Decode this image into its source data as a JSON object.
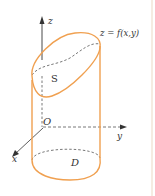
{
  "diagram": {
    "title": "",
    "colors": {
      "surface": "#F0A050",
      "axis": "#333333",
      "dashed": "#555555",
      "edge_line": "#F2E6D8"
    },
    "labels": {
      "z_axis": "z",
      "y_axis": "y",
      "x_axis": "x",
      "origin": "O",
      "surface_eq": "z = f(x,y)",
      "surface_name": "S",
      "region": "D"
    }
  }
}
